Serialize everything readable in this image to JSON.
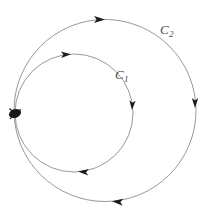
{
  "figure": {
    "kind": "two-tangent-oriented-circles-diagram",
    "background_color": "#ffffff",
    "stroke_color": "#8c8c8c",
    "marker_color": "#1a1a1a",
    "label_color": "#4a4a4a",
    "width": 205,
    "height": 214
  },
  "labels": {
    "c2": {
      "base": "C",
      "sub": "2",
      "x": 160,
      "y": 21
    },
    "c1": {
      "base": "C",
      "sub": "1",
      "x": 115,
      "y": 66
    }
  },
  "curves": [
    {
      "id": "c2",
      "name": "outer-circle",
      "label": "C2",
      "cx": 105,
      "cy": 110.5,
      "r": 91,
      "orientation": "clockwise",
      "stroke_width": 0.9,
      "arrows": [
        {
          "name": "arrow-c2-top",
          "x": 105,
          "y": 19.5,
          "angle": 0,
          "direction": "right"
        },
        {
          "name": "arrow-c2-right",
          "x": 195,
          "y": 108,
          "angle": 90,
          "direction": "down"
        },
        {
          "name": "arrow-c2-bottom",
          "x": 112,
          "y": 201.3,
          "angle": 185,
          "direction": "left"
        }
      ]
    },
    {
      "id": "c1",
      "name": "inner-circle",
      "label": "C1",
      "cx": 74,
      "cy": 113,
      "r": 59,
      "orientation": "clockwise",
      "stroke_width": 0.9,
      "arrows": [
        {
          "name": "arrow-c1-top",
          "x": 71,
          "y": 54.2,
          "angle": -3,
          "direction": "right"
        },
        {
          "name": "arrow-c1-right",
          "x": 132,
          "y": 110,
          "angle": 93,
          "direction": "down"
        },
        {
          "name": "arrow-c1-bottom",
          "x": 78,
          "y": 171.6,
          "angle": 184,
          "direction": "left"
        }
      ]
    }
  ],
  "tangent_point": {
    "name": "tangency-node",
    "x": 15,
    "y": 113.5,
    "rx": 6.2,
    "ry": 4.4,
    "rotation": -18
  }
}
